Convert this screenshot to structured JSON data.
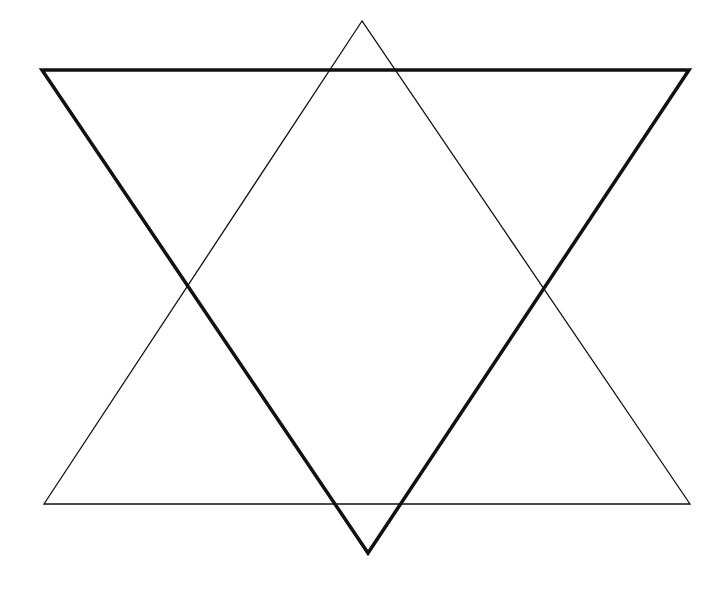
{
  "diagram": {
    "background": "#ffffff",
    "stroke_color": "#111111",
    "shapes": [
      {
        "name": "upward-triangle",
        "style": "thin",
        "stroke_width": 1.3,
        "points": [
          [
            362,
            21
          ],
          [
            44,
            504
          ],
          [
            690,
            504
          ]
        ]
      },
      {
        "name": "downward-triangle",
        "style": "thick",
        "stroke_width": 3.5,
        "points": [
          [
            42,
            70
          ],
          [
            689,
            70
          ],
          [
            368,
            553
          ]
        ]
      }
    ]
  }
}
